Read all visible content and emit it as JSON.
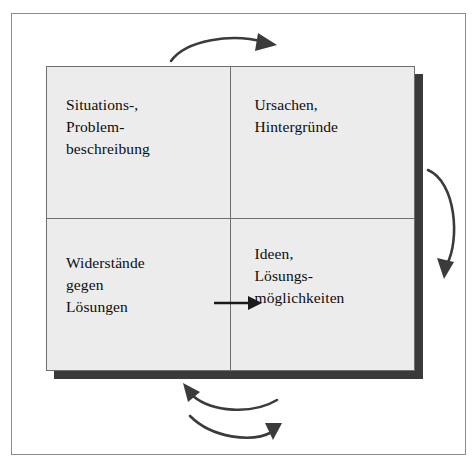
{
  "diagram": {
    "title_visible": false,
    "frame": {
      "name": "outer-border"
    },
    "colors": {
      "cell_fill": "#ececec",
      "cell_border": "#6f6f6f",
      "shadow": "#3a3a3a",
      "arrow": "#3b3b3b",
      "straight_arrow": "#1a1a1a",
      "frame_border": "#8b8b8b",
      "page_background": "#ffffff",
      "text": "#0c0c0c"
    },
    "quadrants": [
      {
        "id": "top-left",
        "position": "top-left",
        "lines": [
          "Situations-,",
          "Problem-",
          "beschreibung"
        ]
      },
      {
        "id": "top-right",
        "position": "top-right",
        "lines": [
          "Ursachen,",
          "Hintergründe"
        ]
      },
      {
        "id": "bottom-left",
        "position": "bottom-left",
        "lines": [
          "Widerstände",
          "gegen",
          "Lösungen"
        ]
      },
      {
        "id": "bottom-right",
        "position": "bottom-right",
        "lines": [
          "Ideen,",
          "Lösungs-",
          "möglichkeiten"
        ]
      }
    ],
    "arrows": [
      {
        "id": "top-arrow",
        "name": "curved-arrow-top",
        "direction": "left-to-right",
        "curve": "convex-up",
        "label": ""
      },
      {
        "id": "right-arrow",
        "name": "curved-arrow-right",
        "direction": "top-to-bottom",
        "curve": "convex-right",
        "label": ""
      },
      {
        "id": "bottom-arrow-upper",
        "name": "curved-arrow-bottom-left",
        "direction": "right-to-left",
        "curve": "concave-up",
        "label": ""
      },
      {
        "id": "bottom-arrow-lower",
        "name": "curved-arrow-bottom-right",
        "direction": "left-to-right",
        "curve": "concave-up",
        "label": ""
      },
      {
        "id": "middle-arrow",
        "name": "straight-arrow-middle",
        "direction": "left-to-right",
        "curve": "straight",
        "label": ""
      }
    ]
  }
}
